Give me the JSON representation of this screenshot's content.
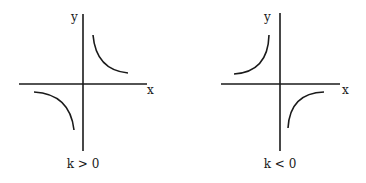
{
  "diagram": {
    "panels": [
      {
        "id": "positive",
        "caption": "k > 0",
        "x_label": "x",
        "y_label": "y",
        "branches": [
          "quadrant I",
          "quadrant III"
        ]
      },
      {
        "id": "negative",
        "caption": "k < 0",
        "x_label": "x",
        "y_label": "y",
        "branches": [
          "quadrant II",
          "quadrant IV"
        ]
      }
    ],
    "colors": {
      "line": "#1a1a1a",
      "background": "#ffffff"
    }
  }
}
